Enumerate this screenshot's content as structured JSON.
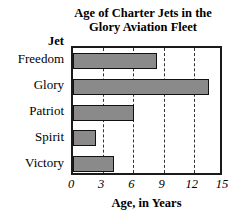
{
  "chart_data": {
    "type": "bar",
    "orientation": "horizontal",
    "title": "Age of Charter Jets in the Glory Aviation Fleet",
    "title_lines": [
      "Age of Charter Jets in the",
      "Glory Aviation Fleet"
    ],
    "xlabel": "Age, in Years",
    "ylabel": "Jet",
    "categories": [
      "Freedom",
      "Glory",
      "Patriot",
      "Spirit",
      "Victory"
    ],
    "values": [
      8.3,
      13.5,
      6.1,
      2.3,
      4.1
    ],
    "xlim": [
      0,
      15
    ],
    "xticks": [
      0,
      3,
      6,
      9,
      12,
      15
    ],
    "xtick_labels": [
      "0",
      "3",
      "6",
      "9",
      "12",
      "15"
    ],
    "grid": "vertical-dashed",
    "legend": "none",
    "bar_color": "#8a8a8a",
    "bar_edge_color": "#111111",
    "frame_color": "#1a1a1a",
    "background": "#ffffff"
  }
}
